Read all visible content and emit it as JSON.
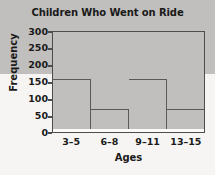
{
  "chart_data": {
    "type": "bar",
    "title": "Children Who Went on Ride",
    "xlabel": "Ages",
    "ylabel": "Frequency",
    "categories": [
      "3–5",
      "6–8",
      "9–11",
      "13–15"
    ],
    "values": [
      127,
      290,
      155,
      60
    ],
    "ylim": [
      0,
      300
    ],
    "yticks": [
      0,
      50,
      100,
      150,
      200,
      250,
      300
    ],
    "ytick_labels": [
      "0",
      "50",
      "100",
      "150",
      "200",
      "250",
      "300"
    ],
    "grid": true,
    "legend": false,
    "legend_position": "none",
    "bar_color": "#c0bfbd",
    "bar_edge_color": "#5a5a5a",
    "axis_color": "#4d4d4d",
    "background_color": "#f6f5f3",
    "plot_background_color": "#fbfaf9",
    "text_color": "#1a1a1a"
  }
}
